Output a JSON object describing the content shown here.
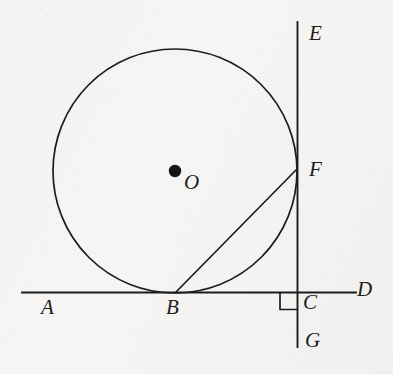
{
  "figure": {
    "kind": "geometry-diagram",
    "background_color": "#f6f5f3",
    "ink_color": "#1d1d1d",
    "canvas": {
      "width": 393,
      "height": 374
    }
  },
  "labels": {
    "A": "A",
    "B": "B",
    "C": "C",
    "D": "D",
    "E": "E",
    "F": "F",
    "G": "G",
    "O": "O"
  },
  "label_positions": {
    "A": {
      "x": 41,
      "y": 297,
      "font_size": 21
    },
    "B": {
      "x": 166,
      "y": 297,
      "font_size": 21
    },
    "C": {
      "x": 303,
      "y": 292,
      "font_size": 21
    },
    "D": {
      "x": 357,
      "y": 279,
      "font_size": 21
    },
    "E": {
      "x": 309,
      "y": 23,
      "font_size": 21
    },
    "F": {
      "x": 309,
      "y": 159,
      "font_size": 21
    },
    "G": {
      "x": 305,
      "y": 330,
      "font_size": 21
    },
    "O": {
      "x": 184,
      "y": 172,
      "font_size": 21
    }
  },
  "geometry": {
    "circle": {
      "cx": 175,
      "cy": 171,
      "r": 122,
      "stroke_width": 1.7,
      "fill": "none"
    },
    "center_dot": {
      "cx": 175,
      "cy": 171,
      "r": 6.2
    },
    "horizontal_line": {
      "x1": 22,
      "y1": 292.5,
      "x2": 356,
      "y2": 292.5,
      "stroke_width": 1.9,
      "name": "line-AD"
    },
    "vertical_line": {
      "x1": 297.5,
      "y1": 22,
      "x2": 297.5,
      "y2": 347,
      "stroke_width": 1.9,
      "name": "line-EG"
    },
    "chord": {
      "x1": 176,
      "y1": 292,
      "x2": 296,
      "y2": 170,
      "stroke_width": 1.7,
      "name": "segment-BF"
    },
    "right_angle_mark": {
      "x": 280,
      "y": 292.5,
      "size": 17,
      "stroke_width": 1.7,
      "orientation": "below-left"
    }
  },
  "points": {
    "A": {
      "x": 22,
      "y": 292.5,
      "role": "left end of line AD"
    },
    "B": {
      "x": 175,
      "y": 292.5,
      "role": "tangent point of circle and line AD"
    },
    "C": {
      "x": 297.5,
      "y": 292.5,
      "role": "intersection of line AD and line EG"
    },
    "D": {
      "x": 356,
      "y": 292.5,
      "role": "right end of line AD"
    },
    "E": {
      "x": 297.5,
      "y": 22,
      "role": "top end of line EG"
    },
    "F": {
      "x": 296,
      "y": 170,
      "role": "intersection of circle and line EG"
    },
    "G": {
      "x": 297.5,
      "y": 347,
      "role": "bottom end of line EG"
    },
    "O": {
      "x": 175,
      "y": 171,
      "role": "center of circle"
    }
  }
}
